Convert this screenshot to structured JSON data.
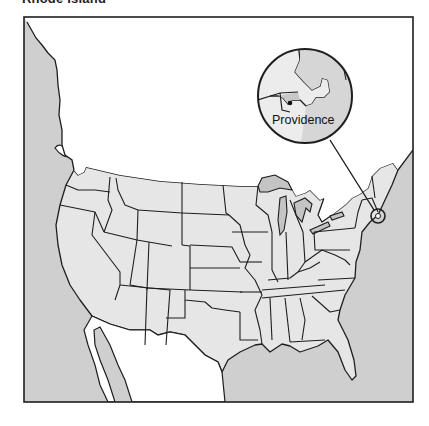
{
  "title": "Rhode Island",
  "map": {
    "region": "Contiguous United States",
    "highlighted_state": "Rhode Island",
    "inset": {
      "label": "Providence",
      "marker": "capital-city-dot"
    },
    "colors": {
      "ocean": "#cfcfcf",
      "land": "#e6e6e6",
      "lake": "#c4c4c4",
      "inset_land": "#d9d9d9",
      "foreign_land": "#ffffff",
      "outline": "#1e1e1e"
    }
  }
}
